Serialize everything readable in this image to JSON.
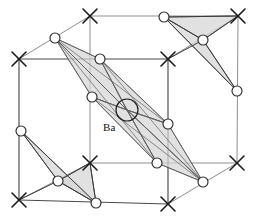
{
  "figure": {
    "type": "crystal-structure-diagram",
    "width": 254,
    "height": 220,
    "background_color": "#ffffff",
    "labels": [
      {
        "id": "ba-label",
        "text": "Ba",
        "x": 103,
        "y": 131,
        "anchor": "start"
      }
    ],
    "colors": {
      "face_fill": "#d5d5d5",
      "edge_front": "#4a4a4a",
      "edge_back": "#8e8e8e",
      "atom_stroke": "#1f1f1f",
      "marker_stroke": "#1a1a1a",
      "label_text": "#111111"
    },
    "cell_vertices": {
      "front_bottom_left": [
        19,
        200
      ],
      "front_bottom_right": [
        168,
        204
      ],
      "front_top_left": [
        19,
        59
      ],
      "front_top_right": [
        168,
        59
      ],
      "back_bottom_left": [
        90,
        163
      ],
      "back_bottom_right": [
        237,
        163
      ],
      "back_top_left": [
        90,
        16
      ],
      "back_top_right": [
        238,
        16
      ]
    },
    "cell_edges_front": [
      [
        [
          19,
          59
        ],
        [
          19,
          200
        ]
      ],
      [
        [
          19,
          200
        ],
        [
          168,
          204
        ]
      ],
      [
        [
          168,
          204
        ],
        [
          168,
          59
        ]
      ],
      [
        [
          168,
          59
        ],
        [
          19,
          59
        ]
      ]
    ],
    "cell_edges_back": [
      [
        [
          90,
          16
        ],
        [
          238,
          16
        ]
      ],
      [
        [
          238,
          16
        ],
        [
          237,
          163
        ]
      ],
      [
        [
          237,
          163
        ],
        [
          90,
          163
        ]
      ],
      [
        [
          90,
          163
        ],
        [
          90,
          16
        ]
      ],
      [
        [
          19,
          59
        ],
        [
          90,
          16
        ]
      ],
      [
        [
          168,
          59
        ],
        [
          238,
          16
        ]
      ],
      [
        [
          168,
          204
        ],
        [
          237,
          163
        ]
      ],
      [
        [
          19,
          200
        ],
        [
          90,
          163
        ]
      ]
    ],
    "corner_markers": [
      {
        "name": "x-marker-front-top-left",
        "x": 19,
        "y": 59,
        "size": 7
      },
      {
        "name": "x-marker-front-top-right",
        "x": 168,
        "y": 59,
        "size": 7
      },
      {
        "name": "x-marker-front-bottom-left",
        "x": 19,
        "y": 200,
        "size": 7
      },
      {
        "name": "x-marker-front-bottom-right",
        "x": 168,
        "y": 204,
        "size": 7
      },
      {
        "name": "x-marker-back-top-left",
        "x": 90,
        "y": 16,
        "size": 7
      },
      {
        "name": "x-marker-back-top-right",
        "x": 238,
        "y": 16,
        "size": 7
      },
      {
        "name": "x-marker-back-bottom-left",
        "x": 90,
        "y": 163,
        "size": 7
      },
      {
        "name": "x-marker-back-bottom-right",
        "x": 237,
        "y": 163,
        "size": 7
      }
    ],
    "atoms": [
      {
        "name": "atom-top-left-apex",
        "x": 55,
        "y": 38,
        "r": 5
      },
      {
        "name": "atom-upper-mid",
        "x": 100,
        "y": 59,
        "r": 5
      },
      {
        "name": "atom-left-mid",
        "x": 92,
        "y": 97,
        "r": 5
      },
      {
        "name": "atom-right-mid",
        "x": 168,
        "y": 124,
        "r": 5
      },
      {
        "name": "atom-lower-mid",
        "x": 157,
        "y": 163,
        "r": 5
      },
      {
        "name": "atom-bottom-right-apex",
        "x": 203,
        "y": 182,
        "r": 5
      },
      {
        "name": "atom-tr-apex",
        "x": 164,
        "y": 17,
        "r": 5
      },
      {
        "name": "atom-tr-center",
        "x": 203,
        "y": 40,
        "r": 5
      },
      {
        "name": "atom-tr-bottom",
        "x": 237,
        "y": 91,
        "r": 5
      },
      {
        "name": "atom-bl-apex",
        "x": 21,
        "y": 131,
        "r": 5
      },
      {
        "name": "atom-bl-center",
        "x": 58,
        "y": 181,
        "r": 5
      },
      {
        "name": "atom-bl-bottom",
        "x": 96,
        "y": 203,
        "r": 5
      }
    ],
    "ba_site": {
      "name": "ba-atom-circle",
      "x": 127,
      "y": 110,
      "r": 11
    },
    "central_polyhedron": {
      "name": "central-polyhedron",
      "faces": [
        [
          [
            55,
            38
          ],
          [
            100,
            59
          ],
          [
            127,
            110
          ]
        ],
        [
          [
            55,
            38
          ],
          [
            92,
            97
          ],
          [
            127,
            110
          ]
        ],
        [
          [
            100,
            59
          ],
          [
            168,
            124
          ],
          [
            127,
            110
          ]
        ],
        [
          [
            92,
            97
          ],
          [
            157,
            163
          ],
          [
            127,
            110
          ]
        ],
        [
          [
            168,
            124
          ],
          [
            203,
            182
          ],
          [
            127,
            110
          ]
        ],
        [
          [
            157,
            163
          ],
          [
            203,
            182
          ],
          [
            127,
            110
          ]
        ]
      ],
      "edges": [
        [
          [
            55,
            38
          ],
          [
            100,
            59
          ]
        ],
        [
          [
            55,
            38
          ],
          [
            92,
            97
          ]
        ],
        [
          [
            55,
            38
          ],
          [
            127,
            110
          ]
        ],
        [
          [
            55,
            38
          ],
          [
            168,
            124
          ]
        ],
        [
          [
            55,
            38
          ],
          [
            157,
            163
          ]
        ],
        [
          [
            100,
            59
          ],
          [
            168,
            124
          ]
        ],
        [
          [
            100,
            59
          ],
          [
            127,
            110
          ]
        ],
        [
          [
            92,
            97
          ],
          [
            127,
            110
          ]
        ],
        [
          [
            92,
            97
          ],
          [
            157,
            163
          ]
        ],
        [
          [
            168,
            124
          ],
          [
            203,
            182
          ]
        ],
        [
          [
            157,
            163
          ],
          [
            203,
            182
          ]
        ],
        [
          [
            127,
            110
          ],
          [
            203,
            182
          ]
        ],
        [
          [
            100,
            59
          ],
          [
            203,
            182
          ]
        ],
        [
          [
            92,
            97
          ],
          [
            203,
            182
          ]
        ],
        [
          [
            127,
            110
          ],
          [
            168,
            124
          ]
        ],
        [
          [
            127,
            110
          ],
          [
            157,
            163
          ]
        ]
      ]
    },
    "corner_polyhedra": [
      {
        "name": "top-right-tetrahedron",
        "faces": [
          [
            [
              164,
              17
            ],
            [
              203,
              40
            ],
            [
              237,
              91
            ]
          ],
          [
            [
              164,
              17
            ],
            [
              203,
              40
            ],
            [
              238,
              16
            ]
          ]
        ],
        "edges": [
          [
            [
              164,
              17
            ],
            [
              203,
              40
            ]
          ],
          [
            [
              203,
              40
            ],
            [
              237,
              91
            ]
          ],
          [
            [
              164,
              17
            ],
            [
              237,
              91
            ]
          ],
          [
            [
              203,
              40
            ],
            [
              238,
              16
            ]
          ],
          [
            [
              164,
              17
            ],
            [
              238,
              16
            ]
          ],
          [
            [
              203,
              40
            ],
            [
              168,
              59
            ]
          ]
        ]
      },
      {
        "name": "bottom-left-tetrahedron",
        "faces": [
          [
            [
              21,
              131
            ],
            [
              58,
              181
            ],
            [
              96,
              203
            ]
          ],
          [
            [
              58,
              181
            ],
            [
              96,
              203
            ],
            [
              90,
              163
            ]
          ]
        ],
        "edges": [
          [
            [
              21,
              131
            ],
            [
              58,
              181
            ]
          ],
          [
            [
              58,
              181
            ],
            [
              96,
              203
            ]
          ],
          [
            [
              21,
              131
            ],
            [
              96,
              203
            ]
          ],
          [
            [
              58,
              181
            ],
            [
              90,
              163
            ]
          ],
          [
            [
              96,
              203
            ],
            [
              90,
              163
            ]
          ],
          [
            [
              58,
              181
            ],
            [
              19,
              200
            ]
          ]
        ]
      }
    ]
  }
}
